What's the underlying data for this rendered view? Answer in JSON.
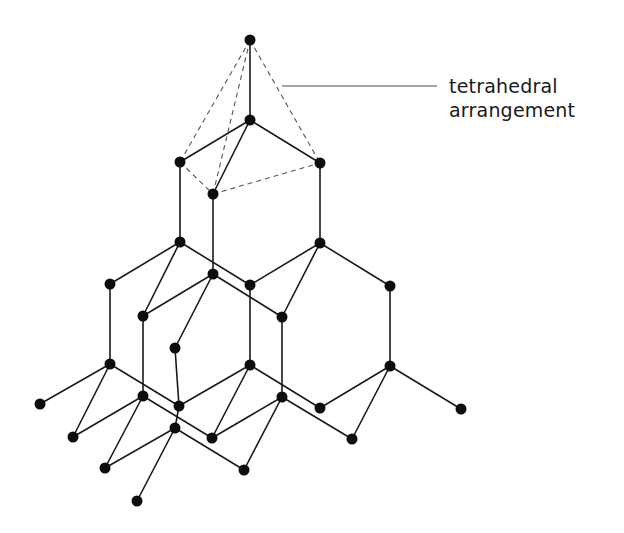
{
  "diagram": {
    "annotation": {
      "line1": "tetrahedral",
      "line2": "arrangement"
    },
    "colors": {
      "atom": "#0d0d0d",
      "bond": "#1a1a1a",
      "tetrahedral_edge": "#555555",
      "background": "#ffffff"
    },
    "atoms": [
      {
        "id": "a0",
        "x": 250,
        "y": 40
      },
      {
        "id": "a1",
        "x": 250,
        "y": 120
      },
      {
        "id": "a2",
        "x": 180,
        "y": 162
      },
      {
        "id": "a3",
        "x": 213,
        "y": 194
      },
      {
        "id": "a4",
        "x": 320,
        "y": 163
      },
      {
        "id": "a5",
        "x": 180,
        "y": 242
      },
      {
        "id": "a6",
        "x": 320,
        "y": 243
      },
      {
        "id": "a7",
        "x": 110,
        "y": 284
      },
      {
        "id": "a8",
        "x": 213,
        "y": 274
      },
      {
        "id": "a9",
        "x": 250,
        "y": 285
      },
      {
        "id": "a10",
        "x": 390,
        "y": 286
      },
      {
        "id": "a11",
        "x": 143,
        "y": 316
      },
      {
        "id": "a12",
        "x": 282,
        "y": 317
      },
      {
        "id": "a13",
        "x": 175,
        "y": 348
      },
      {
        "id": "a14",
        "x": 110,
        "y": 364
      },
      {
        "id": "a15",
        "x": 250,
        "y": 365
      },
      {
        "id": "a16",
        "x": 390,
        "y": 366
      },
      {
        "id": "a17",
        "x": 40,
        "y": 404
      },
      {
        "id": "a18",
        "x": 143,
        "y": 396
      },
      {
        "id": "a19",
        "x": 282,
        "y": 397
      },
      {
        "id": "a20",
        "x": 179,
        "y": 406
      },
      {
        "id": "a21",
        "x": 320,
        "y": 408
      },
      {
        "id": "a22",
        "x": 461,
        "y": 409
      },
      {
        "id": "a23",
        "x": 175,
        "y": 428
      },
      {
        "id": "a24",
        "x": 73,
        "y": 437
      },
      {
        "id": "a25",
        "x": 212,
        "y": 438
      },
      {
        "id": "a26",
        "x": 352,
        "y": 439
      },
      {
        "id": "a27",
        "x": 105,
        "y": 468
      },
      {
        "id": "a28",
        "x": 244,
        "y": 470
      },
      {
        "id": "a29",
        "x": 137,
        "y": 501
      }
    ],
    "bonds": [
      [
        "a0",
        "a1"
      ],
      [
        "a1",
        "a2"
      ],
      [
        "a1",
        "a3"
      ],
      [
        "a1",
        "a4"
      ],
      [
        "a2",
        "a5"
      ],
      [
        "a3",
        "a8"
      ],
      [
        "a4",
        "a6"
      ],
      [
        "a5",
        "a7"
      ],
      [
        "a5",
        "a11"
      ],
      [
        "a5",
        "a9"
      ],
      [
        "a8",
        "a11"
      ],
      [
        "a8",
        "a12"
      ],
      [
        "a8",
        "a13"
      ],
      [
        "a6",
        "a9"
      ],
      [
        "a6",
        "a12"
      ],
      [
        "a6",
        "a10"
      ],
      [
        "a7",
        "a14"
      ],
      [
        "a11",
        "a18"
      ],
      [
        "a13",
        "a20"
      ],
      [
        "a9",
        "a15"
      ],
      [
        "a12",
        "a19"
      ],
      [
        "a10",
        "a16"
      ],
      [
        "a14",
        "a17"
      ],
      [
        "a14",
        "a24"
      ],
      [
        "a14",
        "a20"
      ],
      [
        "a18",
        "a24"
      ],
      [
        "a18",
        "a27"
      ],
      [
        "a18",
        "a25"
      ],
      [
        "a15",
        "a20"
      ],
      [
        "a15",
        "a25"
      ],
      [
        "a15",
        "a21"
      ],
      [
        "a19",
        "a25"
      ],
      [
        "a19",
        "a28"
      ],
      [
        "a19",
        "a26"
      ],
      [
        "a16",
        "a21"
      ],
      [
        "a16",
        "a26"
      ],
      [
        "a16",
        "a22"
      ],
      [
        "a20",
        "a23"
      ],
      [
        "a23",
        "a27"
      ],
      [
        "a23",
        "a29"
      ],
      [
        "a23",
        "a28"
      ]
    ],
    "tetrahedral_edges": [
      [
        "a0",
        "a2"
      ],
      [
        "a0",
        "a3"
      ],
      [
        "a0",
        "a4"
      ],
      [
        "a2",
        "a3"
      ],
      [
        "a3",
        "a4"
      ]
    ],
    "leader": {
      "x1": 282,
      "y1": 86,
      "x2": 437,
      "y2": 86
    }
  }
}
